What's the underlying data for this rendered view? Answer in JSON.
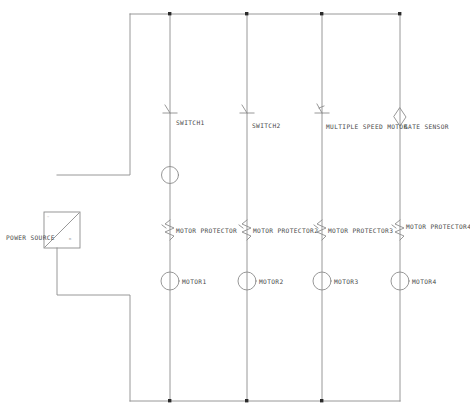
{
  "diagram": {
    "type": "electrical-schematic",
    "style": "hand-drawn pencil sketch, light gray lines on white",
    "colors": {
      "wire": "#8c8c8c",
      "junction": "#2b2b2b",
      "label_text": "#4a4a4a",
      "faint_text": "#efefef",
      "background": "#ffffff"
    },
    "power_source": {
      "label": "POWER SOURCE",
      "symbol": "box-with-diagonal",
      "corner_mark_top_left": "~",
      "corner_mark_bottom_right": "m"
    },
    "branches": [
      {
        "id": "branch-1",
        "switch_label": "SWITCH1",
        "switch_symbol": "normally-open-contact",
        "coil_label": "",
        "coil_symbol": "circle",
        "protector_label": "MOTOR PROTECTOR",
        "protector_symbol": "thermal-overload",
        "motor_label": "MOTOR1",
        "motor_symbol": "circle"
      },
      {
        "id": "branch-2",
        "switch_label": "SWITCH2",
        "switch_symbol": "normally-open-contact",
        "coil_label": "",
        "coil_symbol": "none",
        "protector_label": "MOTOR PROTECTOR2",
        "protector_symbol": "thermal-overload",
        "motor_label": "MOTOR2",
        "motor_symbol": "circle"
      },
      {
        "id": "branch-3",
        "switch_label": "MULTIPLE SPEED MOTOR",
        "switch_symbol": "multi-speed-contact",
        "coil_label": "",
        "coil_symbol": "none",
        "protector_label": "MOTOR PROTECTOR3",
        "protector_symbol": "thermal-overload",
        "motor_label": "MOTOR3",
        "motor_symbol": "circle"
      },
      {
        "id": "branch-4",
        "switch_label": "GATE SENSOR",
        "switch_symbol": "diamond-sensor",
        "coil_label": "",
        "coil_symbol": "none",
        "protector_label": "MOTOR PROTECTOR4",
        "protector_symbol": "thermal-overload",
        "motor_label": "MOTOR4",
        "motor_symbol": "circle"
      }
    ]
  }
}
